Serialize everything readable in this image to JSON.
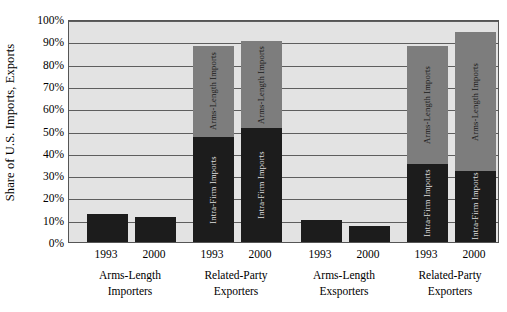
{
  "chart_data": {
    "type": "bar",
    "title": "",
    "subtitle": "",
    "xlabel": "",
    "ylabel": "Share of U.S. Imports, Exports",
    "ylim": [
      0,
      100
    ],
    "y_tick_labels": [
      "100%",
      "90%",
      "80%",
      "70%",
      "60%",
      "50%",
      "40%",
      "30%",
      "20%",
      "10%",
      "0%"
    ],
    "y_tick_values": [
      100,
      90,
      80,
      70,
      60,
      50,
      40,
      30,
      20,
      10,
      0
    ],
    "grid": true,
    "legend_position": "in-bar",
    "stacked": true,
    "segment_names": {
      "dark": "Intra-Firm Imports",
      "gray": "Arms-Length Imports"
    },
    "groups": [
      {
        "label_line1": "Arms-Length",
        "label_line2": "Importers",
        "bars": [
          {
            "year": "1993",
            "total": 12.5,
            "segments": [
              {
                "kind": "dark",
                "name": "Intra-Firm Imports",
                "value": 12.5,
                "show_label": false
              }
            ]
          },
          {
            "year": "2000",
            "total": 11.0,
            "segments": [
              {
                "kind": "dark",
                "name": "Intra-Firm Imports",
                "value": 11.0,
                "show_label": false
              }
            ]
          }
        ]
      },
      {
        "label_line1": "Related-Party",
        "label_line2": "Exporters",
        "bars": [
          {
            "year": "1993",
            "total": 88.0,
            "segments": [
              {
                "kind": "dark",
                "name": "Intra-Firm Imports",
                "value": 47.0,
                "show_label": true
              },
              {
                "kind": "gray",
                "name": "Arms-Length Imports",
                "value": 41.0,
                "show_label": true
              }
            ]
          },
          {
            "year": "2000",
            "total": 90.0,
            "segments": [
              {
                "kind": "dark",
                "name": "Intra-Firm Imports",
                "value": 51.0,
                "show_label": true
              },
              {
                "kind": "gray",
                "name": "Arms-Length Imports",
                "value": 39.0,
                "show_label": true
              }
            ]
          }
        ]
      },
      {
        "label_line1": "Arms-Length",
        "label_line2": "Exsporters",
        "bars": [
          {
            "year": "1993",
            "total": 10.0,
            "segments": [
              {
                "kind": "dark",
                "name": "Intra-Firm Imports",
                "value": 10.0,
                "show_label": false
              }
            ]
          },
          {
            "year": "2000",
            "total": 7.0,
            "segments": [
              {
                "kind": "dark",
                "name": "Intra-Firm Imports",
                "value": 7.0,
                "show_label": false
              }
            ]
          }
        ]
      },
      {
        "label_line1": "Related-Party",
        "label_line2": "Exporters",
        "bars": [
          {
            "year": "1993",
            "total": 88.0,
            "segments": [
              {
                "kind": "dark",
                "name": "Intra-Firm Imports",
                "value": 35.0,
                "show_label": true
              },
              {
                "kind": "gray",
                "name": "Arms-Length Imports",
                "value": 53.0,
                "show_label": true
              }
            ]
          },
          {
            "year": "2000",
            "total": 94.0,
            "segments": [
              {
                "kind": "dark",
                "name": "Intra-Firm Imports",
                "value": 32.0,
                "show_label": true
              },
              {
                "kind": "gray",
                "name": "Arms-Length Imports",
                "value": 62.0,
                "show_label": true
              }
            ]
          }
        ]
      }
    ],
    "colors": {
      "dark_segment": "#1c1c1c",
      "gray_segment": "#7d7d7d",
      "plot_background": "#e3e3e3",
      "gridline": "#5e5e5e",
      "plot_border": "#555555",
      "text": "#000000"
    }
  }
}
